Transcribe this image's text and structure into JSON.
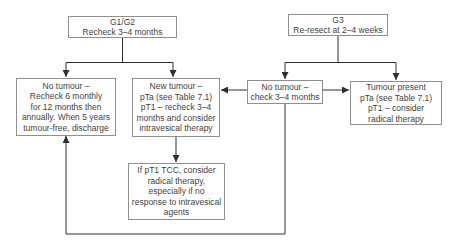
{
  "flowchart": {
    "description": "Bladder tumour follow-up flowchart",
    "colors": {
      "background": "#ffffff",
      "box_border": "#8f8f8f",
      "text": "#3f3f3f",
      "connector": "#2e2e2e"
    },
    "boxes": {
      "g1g2": {
        "lines": [
          "G1/G2",
          "Recheck 3–4 months"
        ]
      },
      "g3": {
        "lines": [
          "G3",
          "Re-resect at 2–4 weeks"
        ]
      },
      "no_tumour_g1g2": {
        "lines": [
          "No tumour –",
          "Recheck 6 monthly",
          "for 12 months then",
          "annually. When 5 years",
          "tumour-free, discharge"
        ]
      },
      "new_tumour": {
        "lines": [
          "New tumour –",
          "pTa (see Table 7.1)",
          "pT1 – recheck 3–4",
          "months and consider",
          "intravesical therapy"
        ]
      },
      "no_tumour_g3": {
        "lines": [
          "No tumour –",
          "check 3–4 months"
        ]
      },
      "tumour_present": {
        "lines": [
          "Tumour present",
          "pTa (see Table 7.1)",
          "pT1 – consider",
          "radical therapy"
        ]
      },
      "pt1_tcc": {
        "lines": [
          "If pT1 TCC, consider",
          "radical therapy,",
          "especially if no",
          "response to intravesical",
          "agents"
        ]
      }
    }
  }
}
